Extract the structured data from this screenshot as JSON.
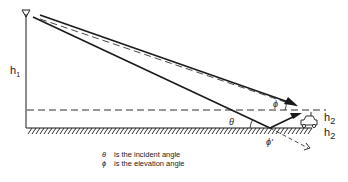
{
  "diagram": {
    "labels": {
      "h1": "h",
      "h1_sub": "1",
      "h2_top": "h",
      "h2_top_sub": "2",
      "h2_bottom": "h",
      "h2_bottom_sub": "2",
      "theta": "θ",
      "phi": "ϕ",
      "phi_prime": "ϕ'"
    },
    "legend": [
      {
        "symbol": "θ",
        "text": "is the incident angle"
      },
      {
        "symbol": "ϕ",
        "text": "is the elevation  angle"
      }
    ],
    "colors": {
      "line": "#1a1a1a",
      "background": "#ffffff"
    }
  }
}
